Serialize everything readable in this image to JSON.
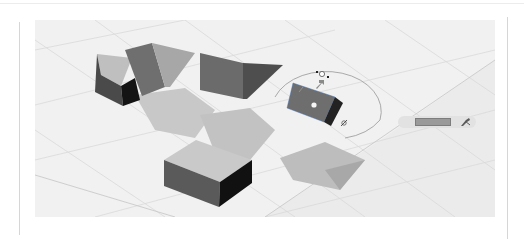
{
  "app": {
    "type": "3d-modeling-viewport",
    "tool_active": "rotate"
  },
  "viewport": {
    "background": "#f1f1f1",
    "grid_color": "#dcdcdc",
    "objects": [
      {
        "name": "wedge-left",
        "kind": "triangular-prism"
      },
      {
        "name": "prism-tilted",
        "kind": "triangular-prism"
      },
      {
        "name": "prism-center",
        "kind": "triangular-prism"
      },
      {
        "name": "prism-selected",
        "kind": "triangular-prism",
        "selected": true
      },
      {
        "name": "box",
        "kind": "box"
      }
    ],
    "colors": {
      "face_light": "#bdbdbd",
      "face_mid": "#7a7a7a",
      "face_dark": "#4a4a4a",
      "face_black": "#141414",
      "shadow": "#c4c4c4",
      "shadow_dark": "#a6a6a6"
    }
  },
  "gizmo": {
    "type": "rotate-protractor",
    "icon": "rotate-arrow-icon"
  },
  "value_input": {
    "value": "",
    "icon": "measure-cursor-icon"
  }
}
